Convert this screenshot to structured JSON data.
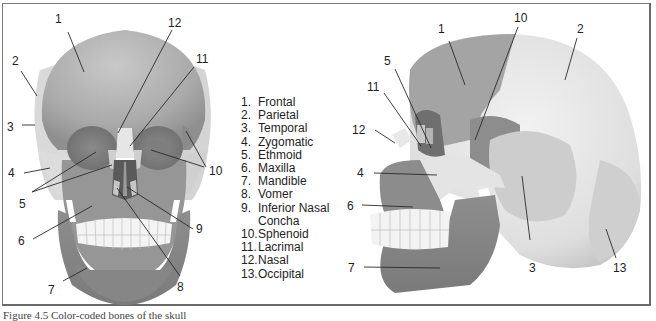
{
  "figure": {
    "type": "labeled anatomical diagram",
    "subject": "Bones of the skull",
    "views": [
      "anterior view",
      "lateral view"
    ]
  },
  "legend": [
    {
      "num": "1.",
      "label": "Frontal"
    },
    {
      "num": "2.",
      "label": "Parietal"
    },
    {
      "num": "3.",
      "label": "Temporal"
    },
    {
      "num": "4.",
      "label": "Zygomatic"
    },
    {
      "num": "5.",
      "label": "Ethmoid"
    },
    {
      "num": "6.",
      "label": "Maxilla"
    },
    {
      "num": "7.",
      "label": "Mandible"
    },
    {
      "num": "8.",
      "label": "Vomer"
    },
    {
      "num": "9.",
      "label": "Inferior Nasal",
      "continuation": "Concha"
    },
    {
      "num": "10.",
      "label": "Sphenoid"
    },
    {
      "num": "11.",
      "label": "Lacrimal"
    },
    {
      "num": "12.",
      "label": "Nasal"
    },
    {
      "num": "13.",
      "label": "Occipital"
    }
  ],
  "front_view_labels": [
    {
      "id": "1",
      "x": 55,
      "y": 13
    },
    {
      "id": "12",
      "x": 168,
      "y": 17
    },
    {
      "id": "11",
      "x": 196,
      "y": 53
    },
    {
      "id": "2",
      "x": 12,
      "y": 55
    },
    {
      "id": "3",
      "x": 7,
      "y": 121
    },
    {
      "id": "10",
      "x": 209,
      "y": 165
    },
    {
      "id": "4",
      "x": 8,
      "y": 167
    },
    {
      "id": "5",
      "x": 19,
      "y": 198
    },
    {
      "id": "9",
      "x": 196,
      "y": 223
    },
    {
      "id": "6",
      "x": 18,
      "y": 235
    },
    {
      "id": "7",
      "x": 48,
      "y": 284
    },
    {
      "id": "8",
      "x": 177,
      "y": 281
    }
  ],
  "side_view_labels": [
    {
      "id": "10",
      "x": 514,
      "y": 12
    },
    {
      "id": "1",
      "x": 438,
      "y": 23
    },
    {
      "id": "2",
      "x": 577,
      "y": 23
    },
    {
      "id": "5",
      "x": 384,
      "y": 55
    },
    {
      "id": "11",
      "x": 367,
      "y": 81
    },
    {
      "id": "12",
      "x": 352,
      "y": 124
    },
    {
      "id": "4",
      "x": 357,
      "y": 167
    },
    {
      "id": "6",
      "x": 347,
      "y": 200
    },
    {
      "id": "3",
      "x": 529,
      "y": 262
    },
    {
      "id": "13",
      "x": 613,
      "y": 262
    },
    {
      "id": "7",
      "x": 348,
      "y": 262
    }
  ],
  "caption": "Figure 4.5 Color-coded bones of the skull"
}
